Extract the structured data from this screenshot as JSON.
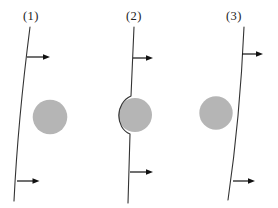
{
  "figure": {
    "background": "#ffffff",
    "colors": {
      "sphere": "#b5b5b5",
      "line": "#333333",
      "arrow": "#111111",
      "label": "#222222"
    },
    "panels": [
      {
        "label": "(1)",
        "label_x": 31,
        "line_path": "M30,27 Q18,120 14,201",
        "sphere": {
          "cx": 50,
          "cy": 117,
          "r": 17.3
        },
        "arrows": [
          {
            "y": 57,
            "x_start": 27,
            "x_tip": 50
          },
          {
            "y": 181,
            "x_start": 17,
            "x_tip": 39.5
          }
        ]
      },
      {
        "label": "(2)",
        "label_x": 134,
        "line_path": "M134,27 L131,96 C115,103 115,128 130,134 L128,203",
        "sphere": {
          "cx": 135,
          "cy": 115,
          "r": 17
        },
        "arrows": [
          {
            "y": 58,
            "x_start": 133,
            "x_tip": 153
          },
          {
            "y": 172,
            "x_start": 130,
            "x_tip": 153
          }
        ]
      },
      {
        "label": "(3)",
        "label_x": 234,
        "line_path": "M244,27 Q240,118 228,200",
        "sphere": {
          "cx": 216,
          "cy": 113,
          "r": 16.7
        },
        "arrows": [
          {
            "y": 54,
            "x_start": 242,
            "x_tip": 263
          },
          {
            "y": 181,
            "x_start": 233,
            "x_tip": 255
          }
        ]
      }
    ],
    "arrow_geometry": {
      "head_length": 7,
      "head_half_width": 2.7,
      "shaft_width": 1.2,
      "line_width": 1.1
    }
  }
}
